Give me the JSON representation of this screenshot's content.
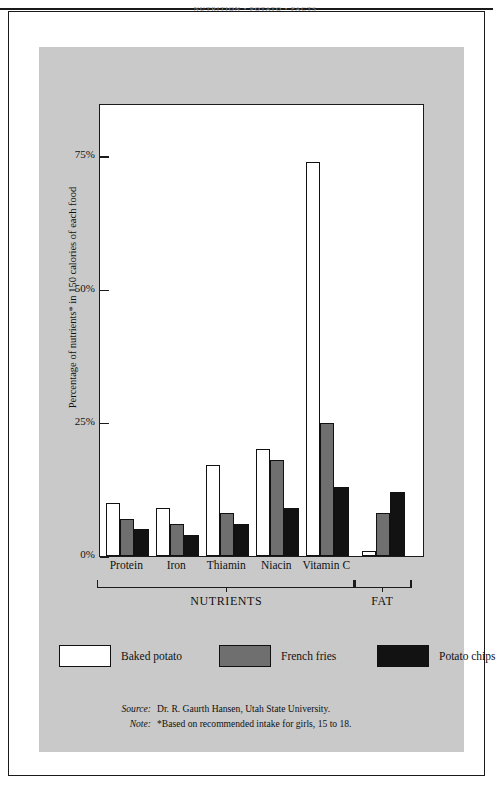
{
  "page": {
    "running_head": "NUTRITION  •  POTATO  •  FACTS"
  },
  "chart_data": {
    "type": "bar",
    "title": "",
    "xlabel": "",
    "ylabel": "Percentage of nutrients* in 150 calories of each food",
    "ylim": [
      0,
      85
    ],
    "ytick_labels": [
      "0%",
      "25%",
      "50%",
      "75%"
    ],
    "ytick_values": [
      0,
      25,
      50,
      75
    ],
    "grid": false,
    "legend_position": "below",
    "categories": [
      "Protein",
      "Iron",
      "Thiamin",
      "Niacin",
      "Vitamin C",
      ""
    ],
    "groups": [
      {
        "label": "NUTRIENTS",
        "categories": [
          "Protein",
          "Iron",
          "Thiamin",
          "Niacin",
          "Vitamin C"
        ]
      },
      {
        "label": "FAT",
        "categories": [
          ""
        ]
      }
    ],
    "series": [
      {
        "name": "Baked potato",
        "color": "#ffffff",
        "values": [
          10,
          9,
          17,
          20,
          74,
          1
        ]
      },
      {
        "name": "French fries",
        "color": "#6f6f6f",
        "values": [
          7,
          6,
          8,
          18,
          25,
          8
        ]
      },
      {
        "name": "Potato chips",
        "color": "#121212",
        "values": [
          5,
          4,
          6,
          9,
          13,
          12
        ]
      }
    ]
  },
  "legend": {
    "items": [
      {
        "label": "Baked potato",
        "swatch": "baked"
      },
      {
        "label": "French fries",
        "swatch": "fries"
      },
      {
        "label": "Potato chips",
        "swatch": "chips"
      }
    ]
  },
  "notes": {
    "source_key": "Source:",
    "source_value": "Dr. R. Gaurth Hansen, Utah State University.",
    "note_key": "Note:",
    "note_value": "*Based on recommended intake for girls, 15 to 18."
  }
}
